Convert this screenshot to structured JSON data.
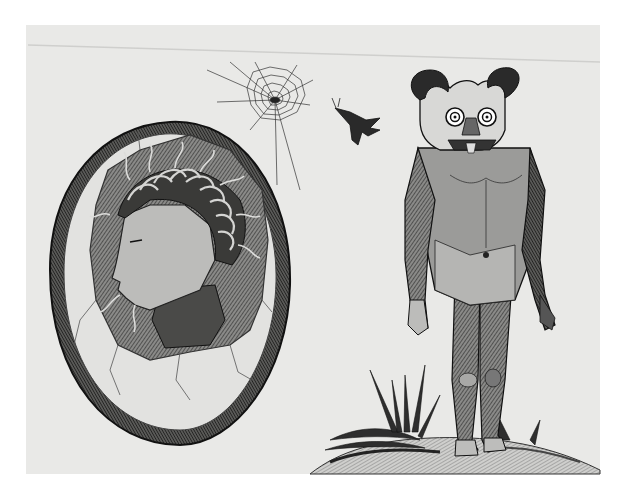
{
  "artwork": {
    "style": "monochrome engraving",
    "colors": {
      "background": "#ffffff",
      "paper": "#e9e9e7",
      "ink": "#1c1c1c",
      "mid": "#6e6e6e",
      "light": "#bdbdbb"
    },
    "elements": [
      "cracked-egg-with-profile-head",
      "spider-web",
      "flying-insect",
      "horned-masked-figure",
      "grass-tuft",
      "ground-mound"
    ]
  }
}
